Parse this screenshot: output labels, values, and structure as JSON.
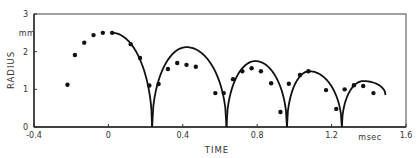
{
  "chart_data": {
    "type": "scatter",
    "title": "",
    "xlabel": "TIME",
    "xunit": "msec",
    "ylabel": "RADIUS",
    "yunit": "mm",
    "xlim": [
      -0.4,
      1.6
    ],
    "ylim": [
      0,
      3
    ],
    "xticks": [
      -0.4,
      0,
      0.4,
      0.8,
      1.2,
      1.6
    ],
    "xtick_labels": [
      "-0.4",
      "0",
      "0.4",
      "0.8",
      "1.2",
      "1.6"
    ],
    "yticks": [
      0,
      1,
      2,
      3
    ],
    "ytick_labels": [
      "0",
      "1",
      "2",
      "3"
    ],
    "grid": false,
    "legend": null,
    "series": [
      {
        "name": "measured",
        "kind": "scatter",
        "marker": "filled-circle",
        "color": "#111111",
        "x": [
          -0.22,
          -0.18,
          -0.13,
          -0.08,
          -0.03,
          0.02,
          0.12,
          0.17,
          0.22,
          0.27,
          0.32,
          0.37,
          0.42,
          0.47,
          0.575,
          0.62,
          0.67,
          0.72,
          0.77,
          0.82,
          0.875,
          0.925,
          0.97,
          1.03,
          1.075,
          1.17,
          1.225,
          1.27,
          1.32,
          1.37,
          1.425
        ],
        "y": [
          1.12,
          1.91,
          2.24,
          2.44,
          2.5,
          2.5,
          2.2,
          1.83,
          1.1,
          1.14,
          1.54,
          1.7,
          1.65,
          1.6,
          0.9,
          0.9,
          1.27,
          1.48,
          1.56,
          1.48,
          1.16,
          0.4,
          1.15,
          1.38,
          1.48,
          0.98,
          0.48,
          1.0,
          1.11,
          1.09,
          0.9
        ]
      },
      {
        "name": "theory",
        "kind": "line",
        "color": "#111111",
        "segments": [
          {
            "start": 0.02,
            "end": 0.235,
            "r_start": 2.5,
            "peak_t": 0.02,
            "peak_r": 2.5,
            "r_end": 0
          },
          {
            "start": 0.235,
            "end": 0.635,
            "r_start": 0,
            "peak_t": 0.42,
            "peak_r": 2.12,
            "r_end": 0
          },
          {
            "start": 0.635,
            "end": 0.96,
            "r_start": 0,
            "peak_t": 0.79,
            "peak_r": 1.75,
            "r_end": 0
          },
          {
            "start": 0.96,
            "end": 1.255,
            "r_start": 0,
            "peak_t": 1.08,
            "peak_r": 1.48,
            "r_end": 0
          },
          {
            "start": 1.255,
            "end": 1.49,
            "r_start": 0,
            "peak_t": 1.37,
            "peak_r": 1.22,
            "r_end": 0.85
          }
        ]
      }
    ]
  }
}
